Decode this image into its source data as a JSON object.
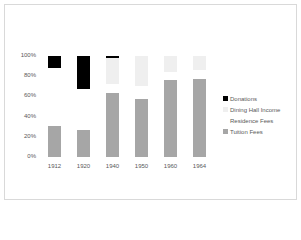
{
  "chart_data": {
    "type": "bar",
    "stacked": "percent",
    "title": "",
    "xlabel": "",
    "ylabel": "",
    "categories": [
      "1912",
      "1920",
      "1940",
      "1950",
      "1960",
      "1964"
    ],
    "series": [
      {
        "name": "Tuition Fees",
        "color": "#a6a6a6",
        "values": [
          31,
          27,
          63,
          57,
          76,
          77
        ]
      },
      {
        "name": "Residence Fees",
        "color": "#ffffff",
        "values": [
          57,
          40,
          9,
          13,
          8,
          9
        ]
      },
      {
        "name": "Dining Hall Income",
        "color": "#efefef",
        "values": [
          0,
          0,
          26,
          30,
          16,
          14
        ]
      },
      {
        "name": "Donations",
        "color": "#000000",
        "values": [
          12,
          33,
          2,
          0,
          0,
          0
        ]
      }
    ],
    "yticks": [
      "0%",
      "20%",
      "40%",
      "60%",
      "80%",
      "100%"
    ],
    "ylim": [
      0,
      100
    ],
    "grid": false,
    "legend_position": "right",
    "legend_order": [
      "Donations",
      "Dining Hall Income",
      "Residence Fees",
      "Tuition Fees"
    ]
  }
}
